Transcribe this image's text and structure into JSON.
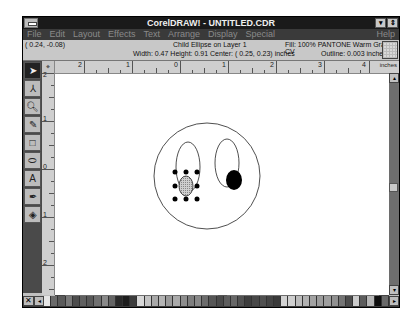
{
  "window": {
    "title": "CorelDRAW! - UNTITLED.CDR",
    "minimize_glyph": "▾",
    "restore_glyph": "⇕"
  },
  "menu": {
    "items": [
      "File",
      "Edit",
      "Layout",
      "Effects",
      "Text",
      "Arrange",
      "Display",
      "Special"
    ],
    "help": "Help"
  },
  "status": {
    "coords": "( 0.24, -0.08)",
    "object_info": "Child Ellipse on Layer 1",
    "dimensions": "Width:  0.47  Height:  0.91  Center: ( 0.25,  0.23)  inches",
    "fill": "Fill:  100% PANTONE Warm Gray 2 CV",
    "outline": "Outline:   0.003 inches"
  },
  "rulers": {
    "horizontal_labels": [
      "2",
      "1",
      "0",
      "1",
      "2",
      "3",
      "4"
    ],
    "units": "inches",
    "vertical_labels": [
      "2",
      "1",
      "0",
      "1",
      "2"
    ]
  },
  "toolbox": {
    "tools": [
      {
        "name": "pick-tool",
        "glyph": "➤",
        "active": true
      },
      {
        "name": "shape-tool",
        "glyph": "⅄",
        "active": false
      },
      {
        "name": "zoom-tool",
        "glyph": "🔍︎",
        "active": false
      },
      {
        "name": "pencil-tool",
        "glyph": "✎",
        "active": false
      },
      {
        "name": "rectangle-tool",
        "glyph": "□",
        "active": false
      },
      {
        "name": "ellipse-tool",
        "glyph": "⬭",
        "active": false
      },
      {
        "name": "text-tool",
        "glyph": "A",
        "active": false
      },
      {
        "name": "outline-tool",
        "glyph": "✒",
        "active": false
      },
      {
        "name": "fill-tool",
        "glyph": "◈",
        "active": false
      }
    ]
  },
  "palette": {
    "no_fill_glyph": "✕",
    "scroll_left_glyph": "◂",
    "scroll_right_glyph": "▸",
    "colors": [
      "#e6e6e6",
      "#6a6a6a",
      "#5a5a5a",
      "#7a7a7a",
      "#4e4e4e",
      "#606060",
      "#585858",
      "#707070",
      "#8a8a8a",
      "#656565",
      "#2a2a2a",
      "#1e1e1e",
      "#3c3c3c",
      "#d8d8d8",
      "#c4c4c4",
      "#a8a8a8",
      "#b4b4b4",
      "#9a9a9a",
      "#aaaaaa",
      "#8e8e8e",
      "#7e7e7e",
      "#888888",
      "#6c6c6c",
      "#565656",
      "#4a4a4a",
      "#5e5e5e",
      "#686868",
      "#525252",
      "#3e3e3e",
      "#484848",
      "#505050",
      "#444444",
      "#3a3a3a",
      "#d2d2d2",
      "#cfcfcf",
      "#bcbcbc",
      "#b2b2b2",
      "#a2a2a2",
      "#9c9c9c",
      "#9e9e9e",
      "#909090",
      "#747474",
      "#4c4c4c",
      "#cccccc",
      "#5c5c5c",
      "#b6b6b6",
      "#0e0e0e",
      "#6a6a6a"
    ]
  },
  "drawing": {
    "selected_object": "Child Ellipse",
    "selected_fill_color": "#bdbdbd",
    "pupil_right_color": "#000000"
  }
}
